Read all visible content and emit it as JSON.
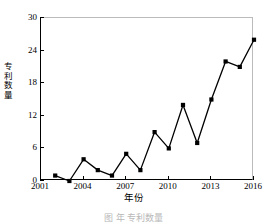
{
  "chart_data": {
    "type": "line",
    "title": "",
    "xlabel": "年份",
    "ylabel": "专利数量",
    "xlim": [
      2001,
      2016
    ],
    "ylim": [
      0,
      30
    ],
    "xticks": [
      2001,
      2004,
      2007,
      2010,
      2013,
      2016
    ],
    "yticks": [
      0,
      6,
      12,
      18,
      24,
      30
    ],
    "grid": false,
    "legend": null,
    "marker": "filled-square",
    "line_color": "#000000",
    "marker_color": "#000000",
    "x": [
      2002,
      2003,
      2004,
      2005,
      2006,
      2007,
      2008,
      2009,
      2010,
      2011,
      2012,
      2013,
      2014,
      2015,
      2016
    ],
    "values": [
      1,
      0,
      4,
      2,
      1,
      5,
      2,
      9,
      6,
      14,
      7,
      15,
      22,
      21,
      26
    ],
    "series": [
      {
        "name": "专利数量",
        "x": [
          2002,
          2003,
          2004,
          2005,
          2006,
          2007,
          2008,
          2009,
          2010,
          2011,
          2012,
          2013,
          2014,
          2015,
          2016
        ],
        "values": [
          1,
          0,
          4,
          2,
          1,
          5,
          2,
          9,
          6,
          14,
          7,
          15,
          22,
          21,
          26
        ]
      }
    ]
  },
  "caption": "图   年  专利数量",
  "axis": {
    "y_tick_labels": [
      "0",
      "6",
      "12",
      "18",
      "24",
      "30"
    ],
    "x_tick_labels": [
      "2001",
      "2004",
      "2007",
      "2010",
      "2013",
      "2016"
    ]
  }
}
